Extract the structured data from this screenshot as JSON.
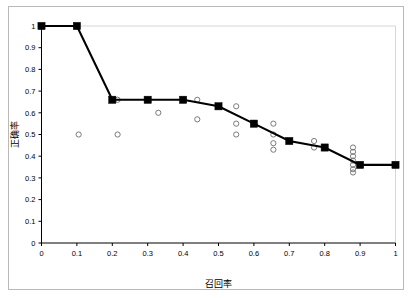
{
  "chart_data": {
    "type": "line",
    "title": "",
    "subtitle": "",
    "xlabel": "召回率",
    "ylabel": "正确率",
    "xlim": [
      0,
      1
    ],
    "ylim": [
      0,
      1
    ],
    "grid": false,
    "legend": "none",
    "x_ticks": [
      "0",
      "0.1",
      "0.2",
      "0.3",
      "0.4",
      "0.5",
      "0.6",
      "0.7",
      "0.8",
      "0.9",
      "1"
    ],
    "x_tick_values": [
      0,
      0.1,
      0.2,
      0.3,
      0.4,
      0.5,
      0.6,
      0.7,
      0.8,
      0.9,
      1
    ],
    "y_ticks": [
      "0",
      "0.1",
      "0.2",
      "0.3",
      "0.4",
      "0.5",
      "0.6",
      "0.7",
      "0.8",
      "0.9",
      "1"
    ],
    "y_tick_values": [
      0,
      0.1,
      0.2,
      0.3,
      0.4,
      0.5,
      0.6,
      0.7,
      0.8,
      0.9,
      1
    ],
    "series": [
      {
        "name": "main-curve",
        "marker": "filled-square",
        "color": "#000000",
        "x": [
          0,
          0.1,
          0.2,
          0.3,
          0.4,
          0.5,
          0.6,
          0.7,
          0.8,
          0.9,
          1
        ],
        "values": [
          1.0,
          1.0,
          0.66,
          0.66,
          0.66,
          0.63,
          0.55,
          0.47,
          0.44,
          0.36,
          0.36
        ]
      },
      {
        "name": "scatter-points",
        "marker": "open-circle",
        "color": "#7a7a7a",
        "points": [
          [
            0.105,
            0.5
          ],
          [
            0.215,
            0.66
          ],
          [
            0.215,
            0.5
          ],
          [
            0.33,
            0.6
          ],
          [
            0.44,
            0.66
          ],
          [
            0.44,
            0.57
          ],
          [
            0.55,
            0.63
          ],
          [
            0.55,
            0.55
          ],
          [
            0.55,
            0.5
          ],
          [
            0.655,
            0.55
          ],
          [
            0.655,
            0.5
          ],
          [
            0.655,
            0.46
          ],
          [
            0.655,
            0.43
          ],
          [
            0.77,
            0.47
          ],
          [
            0.77,
            0.44
          ],
          [
            0.88,
            0.44
          ],
          [
            0.88,
            0.42
          ],
          [
            0.88,
            0.4
          ],
          [
            0.88,
            0.38
          ],
          [
            0.88,
            0.36
          ],
          [
            0.88,
            0.34
          ],
          [
            0.88,
            0.325
          ]
        ]
      }
    ]
  }
}
